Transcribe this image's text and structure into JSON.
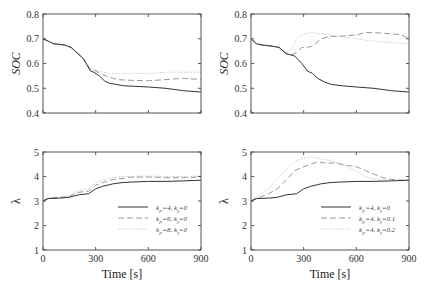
{
  "chart_data": [
    {
      "id": "top-left",
      "type": "line",
      "title": "",
      "xlabel": "",
      "ylabel": "SOC",
      "xlim": [
        0,
        900
      ],
      "ylim": [
        0.4,
        0.8
      ],
      "xticks": [
        0,
        300,
        600,
        900
      ],
      "yticks": [
        0.4,
        0.5,
        0.6,
        0.7,
        0.8
      ],
      "ytick_labels": [
        "0.4",
        "0.5",
        "0.6",
        "0.7",
        "0.8"
      ],
      "grid": false,
      "series": [
        {
          "name": "kP=4, kI=0",
          "style": "solid",
          "color": "#333333",
          "x": [
            0,
            30,
            60,
            120,
            160,
            230,
            270,
            290,
            320,
            350,
            380,
            420,
            460,
            520,
            600,
            700,
            800,
            900
          ],
          "y": [
            0.7,
            0.69,
            0.68,
            0.675,
            0.665,
            0.62,
            0.57,
            0.565,
            0.55,
            0.53,
            0.52,
            0.515,
            0.51,
            0.508,
            0.505,
            0.5,
            0.49,
            0.485
          ]
        },
        {
          "name": "kP=6, kI=0",
          "style": "dashed",
          "color": "#999999",
          "x": [
            0,
            30,
            60,
            120,
            160,
            230,
            270,
            300,
            340,
            380,
            420,
            500,
            600,
            700,
            800,
            900
          ],
          "y": [
            0.7,
            0.69,
            0.68,
            0.675,
            0.665,
            0.62,
            0.575,
            0.57,
            0.555,
            0.545,
            0.535,
            0.532,
            0.53,
            0.535,
            0.54,
            0.535
          ]
        },
        {
          "name": "kP=8, kI=0",
          "style": "dotted",
          "color": "#cccccc",
          "x": [
            0,
            30,
            60,
            120,
            160,
            230,
            270,
            300,
            340,
            380,
            420,
            500,
            600,
            700,
            800,
            900
          ],
          "y": [
            0.7,
            0.69,
            0.68,
            0.675,
            0.665,
            0.62,
            0.58,
            0.575,
            0.565,
            0.56,
            0.56,
            0.56,
            0.56,
            0.565,
            0.565,
            0.565
          ]
        }
      ]
    },
    {
      "id": "top-right",
      "type": "line",
      "title": "",
      "xlabel": "",
      "ylabel": "SOC",
      "xlim": [
        0,
        900
      ],
      "ylim": [
        0.4,
        0.8
      ],
      "xticks": [
        0,
        300,
        600,
        900
      ],
      "yticks": [
        0.4,
        0.5,
        0.6,
        0.7,
        0.8
      ],
      "ytick_labels": [
        "0.4",
        "0.5",
        "0.6",
        "0.7",
        "0.8"
      ],
      "grid": false,
      "series": [
        {
          "name": "kP=4, kI=0",
          "style": "solid",
          "color": "#333333",
          "x": [
            0,
            30,
            60,
            120,
            160,
            200,
            250,
            290,
            320,
            350,
            380,
            420,
            460,
            520,
            600,
            700,
            800,
            900
          ],
          "y": [
            0.7,
            0.68,
            0.675,
            0.67,
            0.665,
            0.64,
            0.63,
            0.6,
            0.57,
            0.56,
            0.54,
            0.525,
            0.515,
            0.51,
            0.505,
            0.5,
            0.49,
            0.485
          ]
        },
        {
          "name": "kP=4, kI=0.1",
          "style": "dashed",
          "color": "#999999",
          "x": [
            0,
            30,
            60,
            120,
            160,
            200,
            230,
            260,
            290,
            320,
            350,
            400,
            450,
            500,
            600,
            650,
            700,
            800,
            860,
            900
          ],
          "y": [
            0.7,
            0.68,
            0.675,
            0.67,
            0.665,
            0.64,
            0.635,
            0.645,
            0.665,
            0.665,
            0.67,
            0.7,
            0.71,
            0.71,
            0.715,
            0.725,
            0.725,
            0.72,
            0.715,
            0.7
          ]
        },
        {
          "name": "kP=4, kI=0.2",
          "style": "dotted",
          "color": "#cccccc",
          "x": [
            0,
            30,
            60,
            120,
            160,
            200,
            230,
            260,
            300,
            350,
            400,
            500,
            600,
            700,
            800,
            900
          ],
          "y": [
            0.7,
            0.68,
            0.675,
            0.67,
            0.665,
            0.645,
            0.655,
            0.7,
            0.72,
            0.725,
            0.72,
            0.71,
            0.7,
            0.69,
            0.685,
            0.68
          ]
        }
      ]
    },
    {
      "id": "bottom-left",
      "type": "line",
      "title": "",
      "xlabel": "Time [s]",
      "ylabel": "λ",
      "xlim": [
        0,
        900
      ],
      "ylim": [
        1,
        5
      ],
      "xticks": [
        0,
        300,
        600,
        900
      ],
      "xtick_labels": [
        "0",
        "300",
        "600",
        "900"
      ],
      "yticks": [
        1,
        2,
        3,
        4,
        5
      ],
      "ytick_labels": [
        "1",
        "2",
        "3",
        "4",
        "5"
      ],
      "grid": false,
      "legend_position": "lower right",
      "series": [
        {
          "name": "kP=4, kI=0",
          "style": "solid",
          "color": "#333333",
          "x": [
            0,
            30,
            100,
            150,
            200,
            260,
            300,
            340,
            400,
            450,
            500,
            600,
            700,
            800,
            900
          ],
          "y": [
            3.0,
            3.1,
            3.12,
            3.15,
            3.25,
            3.3,
            3.5,
            3.6,
            3.7,
            3.75,
            3.77,
            3.8,
            3.8,
            3.82,
            3.85
          ]
        },
        {
          "name": "kP=6, kI=0",
          "style": "dashed",
          "color": "#999999",
          "x": [
            0,
            30,
            100,
            150,
            200,
            260,
            300,
            340,
            400,
            450,
            500,
            600,
            700,
            800,
            900
          ],
          "y": [
            3.0,
            3.12,
            3.15,
            3.18,
            3.35,
            3.4,
            3.65,
            3.75,
            3.88,
            3.92,
            3.97,
            3.98,
            3.95,
            3.95,
            3.98
          ]
        },
        {
          "name": "kP=8, kI=0",
          "style": "dotted",
          "color": "#cccccc",
          "x": [
            0,
            30,
            100,
            150,
            200,
            260,
            300,
            340,
            400,
            450,
            500,
            600,
            700,
            800,
            900
          ],
          "y": [
            3.0,
            3.14,
            3.18,
            3.22,
            3.42,
            3.5,
            3.75,
            3.85,
            3.95,
            4.0,
            4.0,
            4.02,
            4.0,
            4.0,
            4.02
          ]
        }
      ],
      "legend": [
        {
          "label": "kP=4, kI=0",
          "style": "solid"
        },
        {
          "label": "kP=6, kI=0",
          "style": "dashed"
        },
        {
          "label": "kP=8, kI=0",
          "style": "dotted"
        }
      ]
    },
    {
      "id": "bottom-right",
      "type": "line",
      "title": "",
      "xlabel": "Time [s]",
      "ylabel": "λ",
      "xlim": [
        0,
        900
      ],
      "ylim": [
        1,
        5
      ],
      "xticks": [
        0,
        300,
        600,
        900
      ],
      "xtick_labels": [
        "0",
        "300",
        "600",
        "900"
      ],
      "yticks": [
        1,
        2,
        3,
        4,
        5
      ],
      "ytick_labels": [
        "1",
        "2",
        "3",
        "4",
        "5"
      ],
      "grid": false,
      "legend_position": "lower right",
      "series": [
        {
          "name": "kP=4, kI=0",
          "style": "solid",
          "color": "#333333",
          "x": [
            0,
            30,
            100,
            150,
            200,
            260,
            300,
            340,
            400,
            450,
            500,
            600,
            700,
            800,
            900
          ],
          "y": [
            3.0,
            3.1,
            3.12,
            3.15,
            3.25,
            3.3,
            3.5,
            3.6,
            3.7,
            3.75,
            3.77,
            3.8,
            3.8,
            3.82,
            3.85
          ]
        },
        {
          "name": "kP=4, kI=0.1",
          "style": "dashed",
          "color": "#999999",
          "x": [
            0,
            30,
            100,
            150,
            200,
            250,
            300,
            340,
            380,
            420,
            480,
            550,
            600,
            650,
            700,
            750,
            800,
            850,
            900
          ],
          "y": [
            3.0,
            3.1,
            3.3,
            3.5,
            3.85,
            4.25,
            4.4,
            4.5,
            4.6,
            4.55,
            4.55,
            4.45,
            4.4,
            4.25,
            4.1,
            3.95,
            3.88,
            3.85,
            3.85
          ]
        },
        {
          "name": "kP=4, kI=0.2",
          "style": "dotted",
          "color": "#cccccc",
          "x": [
            0,
            30,
            100,
            150,
            200,
            250,
            300,
            340,
            380,
            420,
            480,
            550,
            600,
            650,
            700,
            750,
            800,
            850,
            900
          ],
          "y": [
            3.0,
            3.15,
            3.5,
            3.9,
            4.3,
            4.6,
            4.75,
            4.8,
            4.75,
            4.7,
            4.6,
            4.4,
            4.2,
            4.0,
            3.9,
            3.85,
            3.85,
            3.85,
            3.85
          ]
        }
      ],
      "legend": [
        {
          "label": "kP=4, kI=0",
          "style": "solid"
        },
        {
          "label": "kP=4, kI=0.1",
          "style": "dashed"
        },
        {
          "label": "kP=4, kI=0.2",
          "style": "dotted"
        }
      ]
    }
  ],
  "labels": {
    "soc_ylabel": "SOC",
    "lambda_ylabel": "λ",
    "time_xlabel": "Time [s]"
  },
  "legend_text": {
    "left": [
      {
        "k": "k",
        "sub1": "P",
        "mid": "=4, ",
        "k2": "k",
        "sub2": "I",
        "end": "=0"
      },
      {
        "k": "k",
        "sub1": "P",
        "mid": "=6, ",
        "k2": "k",
        "sub2": "I",
        "end": "=0"
      },
      {
        "k": "k",
        "sub1": "P",
        "mid": "=8, ",
        "k2": "k",
        "sub2": "I",
        "end": "=0"
      }
    ],
    "right": [
      {
        "k": "k",
        "sub1": "P",
        "mid": "=4, ",
        "k2": "k",
        "sub2": "I",
        "end": "=0"
      },
      {
        "k": "k",
        "sub1": "P",
        "mid": "=4, ",
        "k2": "k",
        "sub2": "I",
        "end": "=0.1"
      },
      {
        "k": "k",
        "sub1": "P",
        "mid": "=4, ",
        "k2": "k",
        "sub2": "I",
        "end": "=0.2"
      }
    ]
  },
  "colors": {
    "solid": "#333333",
    "dashed": "#999999",
    "dotted": "#cccccc",
    "frame": "#555555"
  }
}
